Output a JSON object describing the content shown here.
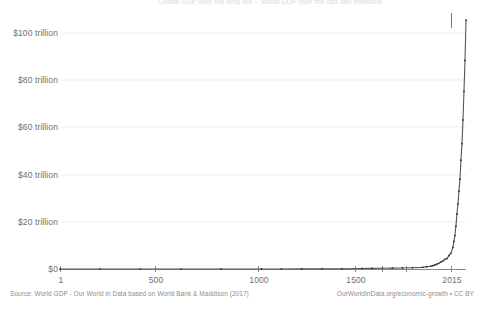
{
  "chart_data": {
    "type": "line",
    "title": "Global GDP over the long run  –  World GDP over the last two millennia",
    "xlabel": "",
    "ylabel": "",
    "xlim": [
      1,
      2015
    ],
    "ylim": [
      0,
      108
    ],
    "grid": true,
    "legend": null,
    "unit": "trillion international-$",
    "y_ticks": [
      {
        "value": 0,
        "label": "$0"
      },
      {
        "value": 20,
        "label": "$20 trillion"
      },
      {
        "value": 40,
        "label": "$40 trillion"
      },
      {
        "value": 60,
        "label": "$60 trillion"
      },
      {
        "value": 80,
        "label": "$80 trillion"
      },
      {
        "value": 100,
        "label": "$100 trillion"
      }
    ],
    "x_ticks": [
      {
        "value": 1,
        "label": "1"
      },
      {
        "value": 500,
        "label": "500"
      },
      {
        "value": 1000,
        "label": "1000"
      },
      {
        "value": 1500,
        "label": "1500"
      },
      {
        "value": 2015,
        "label": "2015"
      }
    ],
    "series": [
      {
        "name": "World GDP",
        "color": "#555555",
        "markers": true,
        "x": [
          1,
          200,
          400,
          600,
          800,
          1000,
          1100,
          1200,
          1300,
          1400,
          1500,
          1550,
          1600,
          1650,
          1700,
          1750,
          1800,
          1820,
          1840,
          1850,
          1860,
          1870,
          1880,
          1890,
          1900,
          1910,
          1920,
          1930,
          1940,
          1950,
          1955,
          1960,
          1965,
          1970,
          1975,
          1980,
          1985,
          1990,
          1995,
          2000,
          2005,
          2010,
          2015
        ],
        "y": [
          0.18,
          0.19,
          0.18,
          0.19,
          0.2,
          0.21,
          0.23,
          0.25,
          0.27,
          0.27,
          0.43,
          0.46,
          0.5,
          0.56,
          0.64,
          0.76,
          0.9,
          1.2,
          1.4,
          1.6,
          1.9,
          2.2,
          2.6,
          3.1,
          3.6,
          4.3,
          4.6,
          5.8,
          6.8,
          9.3,
          11.8,
          14.3,
          18.2,
          23.4,
          27.5,
          33.0,
          38.0,
          46.0,
          53.0,
          63.0,
          75.0,
          88.0,
          105.0
        ]
      }
    ],
    "source_note": "Source: World GDP - Our World in Data based on World Bank & Maddison (2017)",
    "credit_note": "OurWorldInData.org/economic-growth • CC BY"
  },
  "axis": {
    "y_label_0": "$0",
    "y_label_20": "$20 trillion",
    "y_label_40": "$40 trillion",
    "y_label_60": "$60 trillion",
    "y_label_80": "$80 trillion",
    "y_label_100": "$100 trillion",
    "x_label_1": "1",
    "x_label_500": "500",
    "x_label_1000": "1000",
    "x_label_1500": "1500",
    "x_label_2015": "2015"
  },
  "footer": {
    "source": "Source: World GDP - Our World in Data based on World Bank & Maddison (2017)",
    "credit": "OurWorldInData.org/economic-growth • CC BY"
  }
}
